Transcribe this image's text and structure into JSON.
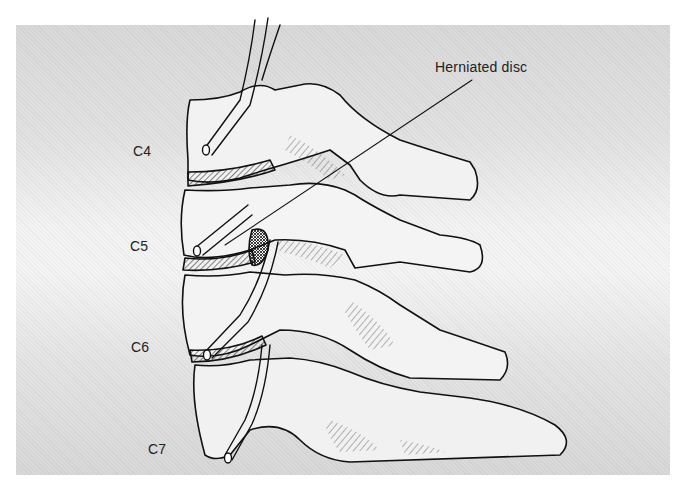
{
  "figure": {
    "labels": {
      "herniated_disc": "Herniated disc",
      "c4": "C4",
      "c5": "C5",
      "c6": "C6",
      "c7": "C7"
    },
    "colors": {
      "ink": "#111111",
      "background_edge": "#d9d9d9",
      "background_center": "#f4f4f4",
      "page": "#ffffff"
    }
  }
}
